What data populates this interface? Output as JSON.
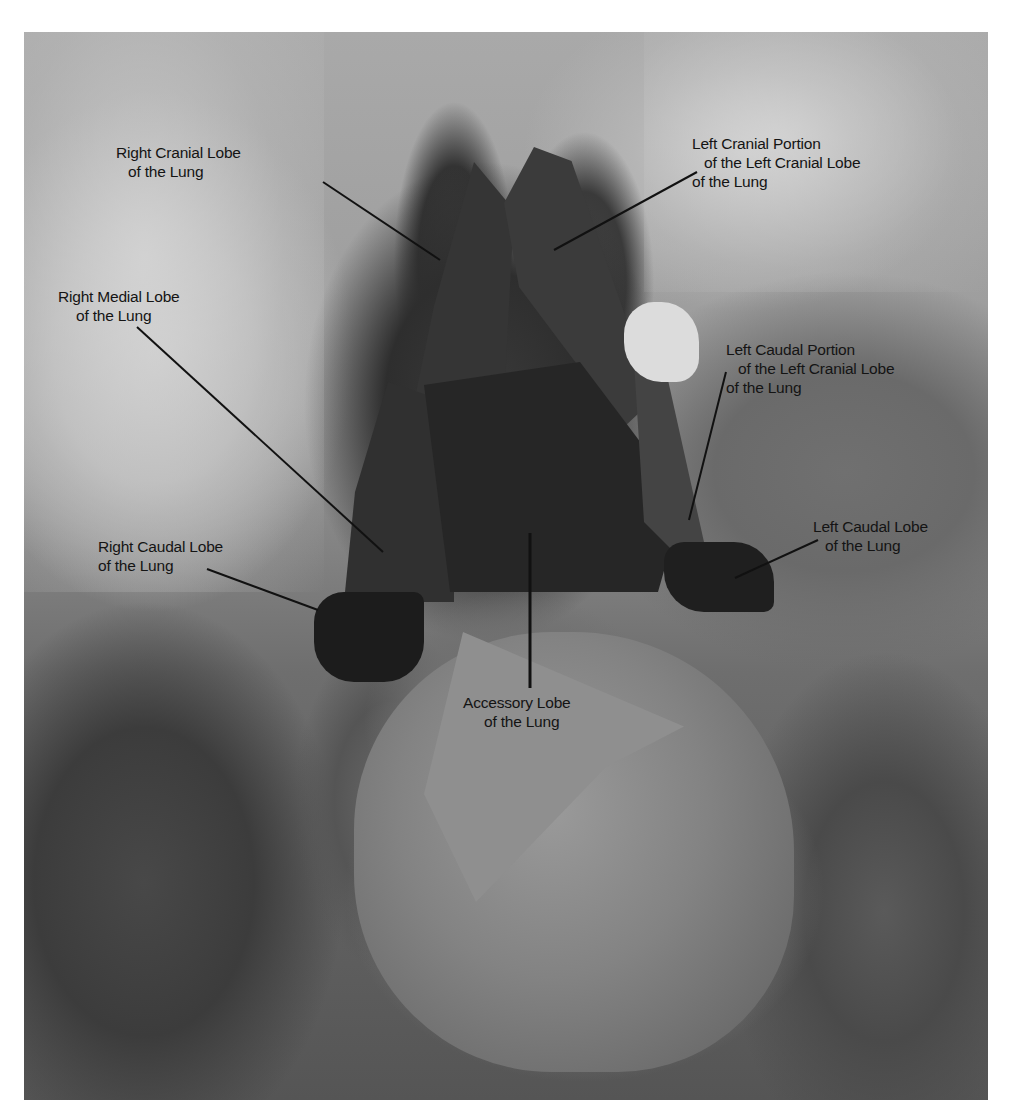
{
  "image": {
    "description": "Grayscale dissection photograph of the thoracic cavity showing lung lobes with annotation labels and leader lines",
    "colors": {
      "background": "#ffffff",
      "label_text": "#141414",
      "leader_line": "#111111"
    }
  },
  "labels": [
    {
      "id": "right-cranial-lobe",
      "lines": [
        "Right Cranial Lobe",
        "of the Lung"
      ],
      "text_pos": [
        116,
        143
      ],
      "line_indent": [
        0,
        12
      ],
      "leader": [
        [
          323,
          182
        ],
        [
          440,
          260
        ]
      ]
    },
    {
      "id": "left-cranial-portion",
      "lines": [
        "Left Cranial Portion",
        "of the Left Cranial Lobe",
        "of the Lung"
      ],
      "text_pos": [
        692,
        134
      ],
      "line_indent": [
        0,
        12,
        0
      ],
      "leader": [
        [
          697,
          172
        ],
        [
          554,
          250
        ]
      ]
    },
    {
      "id": "right-medial-lobe",
      "lines": [
        "Right Medial Lobe",
        "of the Lung"
      ],
      "text_pos": [
        58,
        287
      ],
      "line_indent": [
        0,
        18
      ],
      "leader": [
        [
          137,
          327
        ],
        [
          383,
          552
        ]
      ]
    },
    {
      "id": "left-caudal-portion",
      "lines": [
        "Left Caudal Portion",
        "of the Left Cranial Lobe",
        "of the Lung"
      ],
      "text_pos": [
        726,
        340
      ],
      "line_indent": [
        0,
        12,
        0
      ],
      "leader": [
        [
          726,
          372
        ],
        [
          689,
          520
        ]
      ]
    },
    {
      "id": "left-caudal-lobe",
      "lines": [
        "Left Caudal Lobe",
        "of the Lung"
      ],
      "text_pos": [
        813,
        517
      ],
      "line_indent": [
        0,
        12
      ],
      "leader": [
        [
          818,
          540
        ],
        [
          735,
          578
        ]
      ]
    },
    {
      "id": "right-caudal-lobe",
      "lines": [
        "Right Caudal Lobe",
        "of the Lung"
      ],
      "text_pos": [
        98,
        537
      ],
      "line_indent": [
        0,
        0
      ],
      "leader": [
        [
          207,
          569
        ],
        [
          318,
          610
        ]
      ]
    },
    {
      "id": "accessory-lobe",
      "lines": [
        "Accessory Lobe",
        "of the Lung"
      ],
      "text_pos": [
        463,
        693
      ],
      "line_indent": [
        0,
        21
      ],
      "leader": [
        [
          530,
          533
        ],
        [
          530,
          688
        ]
      ]
    }
  ]
}
